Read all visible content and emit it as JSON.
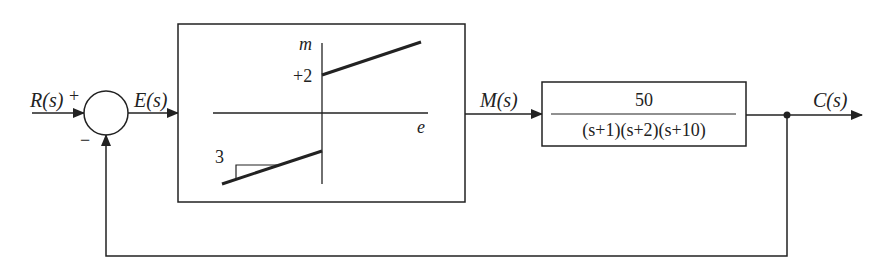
{
  "diagram": {
    "type": "feedback-control-block-diagram",
    "signals": {
      "input": "R(s)",
      "error": "E(s)",
      "manipulated": "M(s)",
      "output": "C(s)"
    },
    "summing_junction": {
      "plus_sign": "+",
      "minus_sign": "−"
    },
    "nonlinearity": {
      "vertical_axis_label": "m",
      "horizontal_axis_label": "e",
      "offset_label": "+2",
      "slope_label": "3"
    },
    "plant": {
      "numerator": "50",
      "denominator": "(s+1)(s+2)(s+10)"
    }
  },
  "colors": {
    "line": "#222222",
    "background": "#ffffff"
  }
}
